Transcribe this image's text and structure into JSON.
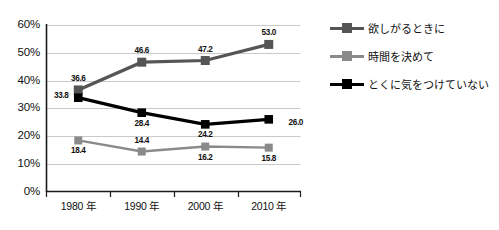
{
  "title": {
    "text": "",
    "cropped": true
  },
  "chart_data": {
    "type": "line",
    "title": "",
    "xlabel": "",
    "ylabel": "",
    "categories": [
      "1980 年",
      "1990 年",
      "2000 年",
      "2010 年"
    ],
    "ylim": [
      0,
      60
    ],
    "ytick_labels": [
      "0%",
      "10%",
      "20%",
      "30%",
      "40%",
      "50%",
      "60%"
    ],
    "ytick_values": [
      0,
      10,
      20,
      30,
      40,
      50,
      60
    ],
    "grid": true,
    "legend_position": "right",
    "series": [
      {
        "name": "欲しがるときに",
        "color": "#555555",
        "values": [
          36.6,
          46.6,
          47.2,
          53.0
        ],
        "labels": [
          "36.6",
          "46.6",
          "47.2",
          "53.0"
        ],
        "label_positions": [
          "above",
          "above",
          "above",
          "above"
        ]
      },
      {
        "name": "時間を決めて",
        "color": "#8a8a8a",
        "values": [
          18.4,
          14.4,
          16.2,
          15.8
        ],
        "labels": [
          "18.4",
          "14.4",
          "16.2",
          "15.8"
        ],
        "label_positions": [
          "below",
          "above",
          "below",
          "below"
        ]
      },
      {
        "name": "とくに気をつけていない",
        "color": "#000000",
        "values": [
          33.8,
          28.4,
          24.2,
          26.0
        ],
        "labels": [
          "33.8",
          "28.4",
          "24.2",
          "26.0"
        ],
        "label_positions": [
          "left",
          "below",
          "below",
          "right"
        ]
      }
    ]
  },
  "legend": {
    "items": [
      {
        "label": "欲しがるときに",
        "color": "#555555"
      },
      {
        "label": "時間を決めて",
        "color": "#8a8a8a"
      },
      {
        "label": "とくに気をつけていない",
        "color": "#000000"
      }
    ]
  },
  "axes": {
    "y_labels": [
      "60%",
      "50%",
      "40%",
      "30%",
      "20%",
      "10%",
      "0%"
    ],
    "x_labels": [
      "1980 年",
      "1990 年",
      "2000 年",
      "2010 年"
    ]
  }
}
